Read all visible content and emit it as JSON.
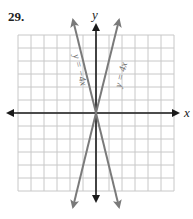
{
  "problem_number": "29.",
  "graph": {
    "x_axis_label": "x",
    "y_axis_label": "y",
    "grid": {
      "xmin": -6,
      "xmax": 6,
      "ymin": -6,
      "ymax": 6,
      "step": 1
    },
    "lines": [
      {
        "equation": "y = 4x",
        "slope": 4,
        "intercept": 0
      },
      {
        "equation": "y = −4x",
        "slope": -4,
        "intercept": 0
      }
    ],
    "colors": {
      "grid": "#c8c8c8",
      "axes": "#1a1a1a",
      "lines": "#7a7a7a"
    }
  }
}
